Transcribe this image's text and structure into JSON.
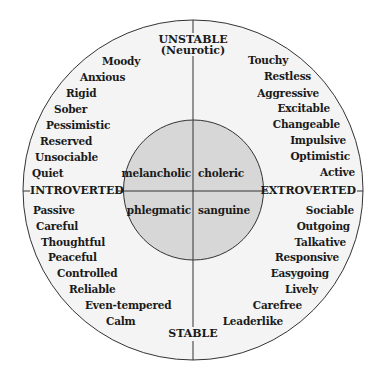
{
  "colors": {
    "background": "#ffffff",
    "outer_circle_fill": "#f4f4f4",
    "inner_circle_fill": "#d7d7d7",
    "stroke": "#333333",
    "text": "#1a1a1a"
  },
  "geometry": {
    "center": [
      193,
      190
    ],
    "outer_radius": 170,
    "inner_radius": 70
  },
  "axes": {
    "top": [
      "UNSTABLE",
      "(Neurotic)"
    ],
    "bottom": "STABLE",
    "left": "INTROVERTED",
    "right": "EXTROVERTED"
  },
  "temperaments": {
    "top_left": "melancholic",
    "top_right": "choleric",
    "bottom_left": "phlegmatic",
    "bottom_right": "sanguine"
  },
  "traits": {
    "unstable_introverted": [
      "Moody",
      "Anxious",
      "Rigid",
      "Sober",
      "Pessimistic",
      "Reserved",
      "Unsociable",
      "Quiet"
    ],
    "unstable_extroverted": [
      "Touchy",
      "Restless",
      "Aggressive",
      "Excitable",
      "Changeable",
      "Impulsive",
      "Optimistic",
      "Active"
    ],
    "stable_introverted": [
      "Passive",
      "Careful",
      "Thoughtful",
      "Peaceful",
      "Controlled",
      "Reliable",
      "Even-tempered",
      "Calm"
    ],
    "stable_extroverted": [
      "Sociable",
      "Outgoing",
      "Talkative",
      "Responsive",
      "Easygoing",
      "Lively",
      "Carefree",
      "Leaderlike"
    ]
  }
}
